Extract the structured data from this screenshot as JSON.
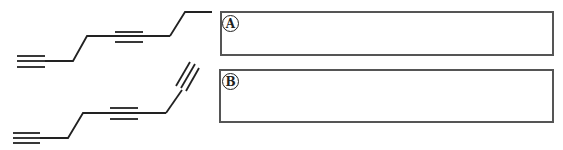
{
  "diagram": {
    "type": "skeletal structure formulas with answer boxes",
    "colors": {
      "line": "#222222",
      "box_border": "#555555",
      "background": "#ffffff"
    },
    "items": [
      {
        "label": "A",
        "molecule": "chain with two internal/terminal triple bonds (A)",
        "answer": ""
      },
      {
        "label": "B",
        "molecule": "chain with three triple bonds (B)",
        "answer": ""
      }
    ]
  }
}
